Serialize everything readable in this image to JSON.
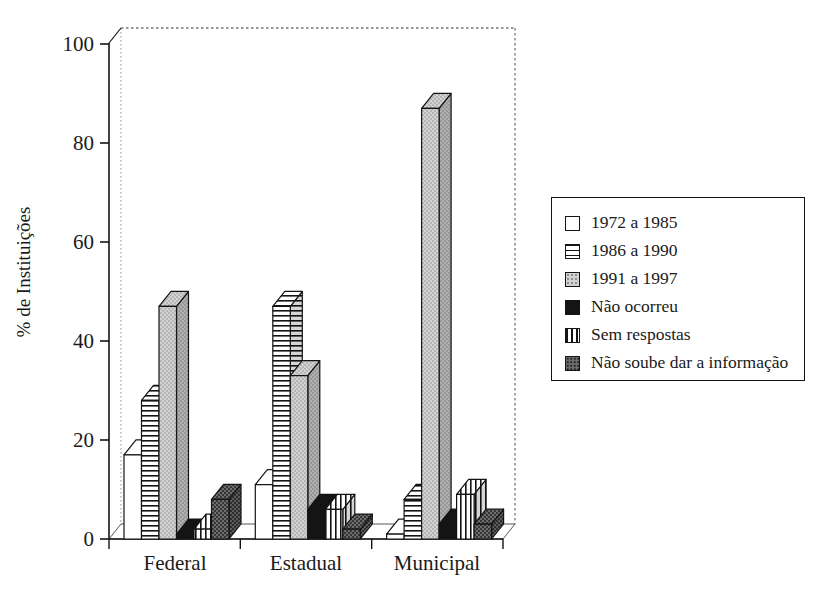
{
  "chart_data": {
    "type": "bar",
    "effect": "3d-column",
    "categories": [
      "Federal",
      "Estadual",
      "Municipal"
    ],
    "series": [
      {
        "name": "1972 a 1985",
        "pattern": "plain-white",
        "values": [
          17,
          11,
          1
        ]
      },
      {
        "name": "1986 a 1990",
        "pattern": "horizontal-stripes",
        "values": [
          28,
          47,
          8
        ]
      },
      {
        "name": "1991 a 1997",
        "pattern": "light-dots",
        "values": [
          47,
          33,
          87
        ]
      },
      {
        "name": "Não ocorreu",
        "pattern": "solid-black",
        "values": [
          1,
          6,
          3
        ]
      },
      {
        "name": "Sem respostas",
        "pattern": "vertical-stripes",
        "values": [
          2,
          6,
          9
        ]
      },
      {
        "name": "Não soube dar a informação",
        "pattern": "dark-dots",
        "values": [
          8,
          2,
          3
        ]
      }
    ],
    "ylabel": "% de Instituições",
    "xlabel": "",
    "ylim": [
      0,
      100
    ],
    "ytick_labels": [
      "0",
      "20",
      "40",
      "60",
      "80",
      "100"
    ],
    "grid": false,
    "legend_position": "right"
  },
  "colors": {
    "ink": "#141414",
    "light_gray_fill": "#d2d2d2",
    "dark_gray_fill": "#6d6d6d",
    "wall_dash": "#777777",
    "background": "#ffffff"
  }
}
